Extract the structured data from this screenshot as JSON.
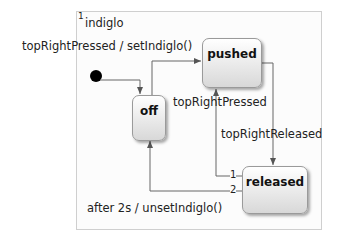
{
  "region": {
    "index": "1",
    "name": "indiglo"
  },
  "states": [
    {
      "id": "pushed",
      "label": "pushed"
    },
    {
      "id": "off",
      "label": "off"
    },
    {
      "id": "released",
      "label": "released"
    }
  ],
  "transitions": {
    "off_to_pushed": "topRightPressed / setIndiglo()",
    "released_to_pushed": "topRightPressed",
    "pushed_to_released": "topRightReleased",
    "released_to_off": "after 2s / unsetIndiglo()",
    "priority_1": "1",
    "priority_2": "2"
  }
}
